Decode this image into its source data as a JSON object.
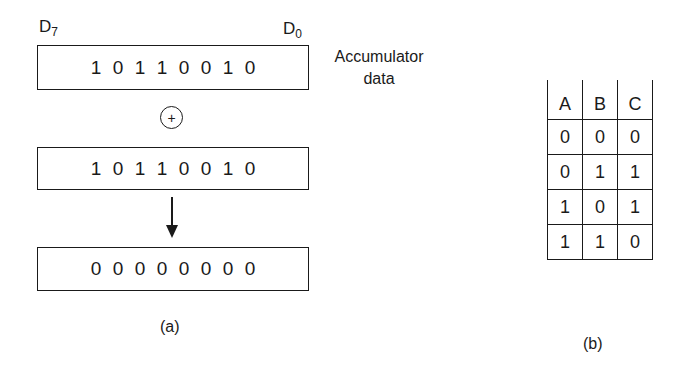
{
  "figure_a": {
    "msb_label": "D",
    "msb_sub": "7",
    "lsb_label": "D",
    "lsb_sub": "0",
    "side_label_line1": "Accumulator",
    "side_label_line2": "data",
    "register_1": [
      "1",
      "0",
      "1",
      "1",
      "0",
      "0",
      "1",
      "0"
    ],
    "operator": "+",
    "register_2": [
      "1",
      "0",
      "1",
      "1",
      "0",
      "0",
      "1",
      "0"
    ],
    "result": [
      "0",
      "0",
      "0",
      "0",
      "0",
      "0",
      "0",
      "0"
    ],
    "caption": "(a)"
  },
  "figure_b": {
    "headers": [
      "A",
      "B",
      "C"
    ],
    "rows": [
      [
        "0",
        "0",
        "0"
      ],
      [
        "0",
        "1",
        "1"
      ],
      [
        "1",
        "0",
        "1"
      ],
      [
        "1",
        "1",
        "0"
      ]
    ],
    "caption": "(b)"
  }
}
